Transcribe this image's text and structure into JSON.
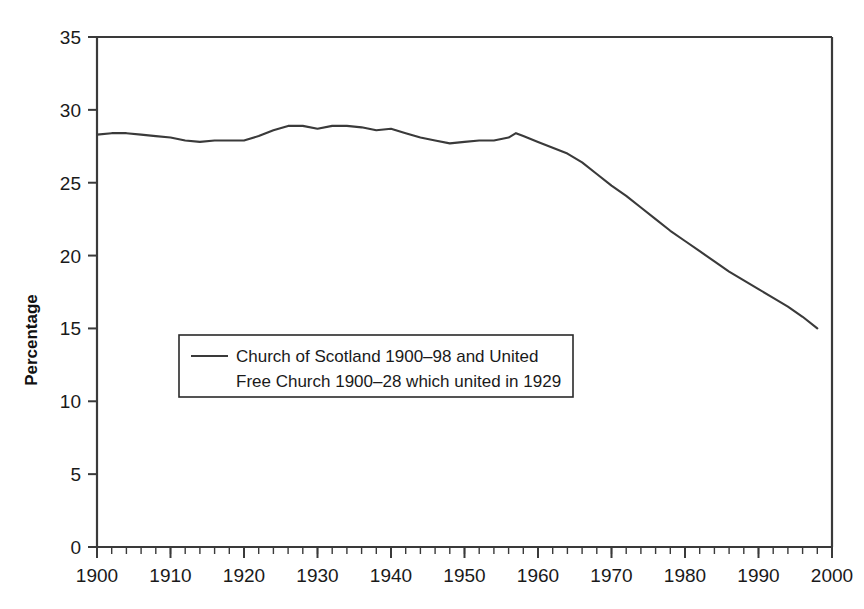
{
  "chart_data": {
    "type": "line",
    "title": "",
    "subtitle": "",
    "xlabel": "",
    "ylabel": "Percentage",
    "xlim": [
      1900,
      2000
    ],
    "ylim": [
      0,
      35
    ],
    "grid": false,
    "legend_position": "inside-left-middle",
    "x_ticks": [
      "1900",
      "1910",
      "1920",
      "1930",
      "1940",
      "1950",
      "1960",
      "1970",
      "1980",
      "1990",
      "2000"
    ],
    "x_tick_values": [
      1900,
      1910,
      1920,
      1930,
      1940,
      1950,
      1960,
      1970,
      1980,
      1990,
      2000
    ],
    "x_minor_tick_step": 2,
    "y_ticks": [
      "0",
      "5",
      "10",
      "15",
      "20",
      "25",
      "30",
      "35"
    ],
    "y_tick_values": [
      0,
      5,
      10,
      15,
      20,
      25,
      30,
      35
    ],
    "series": [
      {
        "name": "Church of Scotland 1900–98 and United Free Church 1900–28 which united in 1929",
        "color": "#3a3a3a",
        "x": [
          1900,
          1902,
          1904,
          1906,
          1908,
          1910,
          1912,
          1914,
          1916,
          1918,
          1920,
          1922,
          1924,
          1926,
          1928,
          1930,
          1932,
          1934,
          1936,
          1938,
          1940,
          1942,
          1944,
          1946,
          1948,
          1950,
          1952,
          1954,
          1956,
          1957,
          1958,
          1960,
          1962,
          1964,
          1966,
          1968,
          1970,
          1972,
          1974,
          1976,
          1978,
          1980,
          1982,
          1984,
          1986,
          1988,
          1990,
          1992,
          1994,
          1996,
          1998
        ],
        "y": [
          28.3,
          28.4,
          28.4,
          28.3,
          28.2,
          28.1,
          27.9,
          27.8,
          27.9,
          27.9,
          27.9,
          28.2,
          28.6,
          28.9,
          28.9,
          28.7,
          28.9,
          28.9,
          28.8,
          28.6,
          28.7,
          28.4,
          28.1,
          27.9,
          27.7,
          27.8,
          27.9,
          27.9,
          28.1,
          28.4,
          28.2,
          27.8,
          27.4,
          27.0,
          26.4,
          25.6,
          24.8,
          24.1,
          23.3,
          22.5,
          21.7,
          21.0,
          20.3,
          19.6,
          18.9,
          18.3,
          17.7,
          17.1,
          16.5,
          15.8,
          15.0
        ]
      }
    ],
    "legend": [
      {
        "line1": "Church of Scotland 1900–98 and United",
        "line2": "Free Church 1900–28 which united in 1929",
        "color": "#3a3a3a"
      }
    ]
  },
  "colors": {
    "axis": "#3a3a3a",
    "line": "#3a3a3a",
    "text": "#1a1a1a",
    "background": "#ffffff"
  }
}
